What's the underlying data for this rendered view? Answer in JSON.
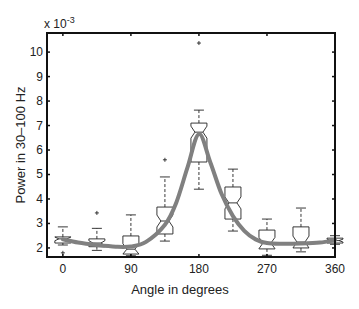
{
  "chart_data": {
    "type": "boxplot",
    "title": "",
    "xlabel": "Angle in degrees",
    "ylabel": "Power in 30–100 Hz",
    "y_multiplier_label": "x 10",
    "y_multiplier_exponent": "-3",
    "xlim": [
      -21,
      360
    ],
    "ylim": [
      1.63,
      10.78
    ],
    "xticks": [
      0,
      90,
      180,
      270,
      360
    ],
    "xtick_labels": [
      "0",
      "90",
      "180",
      "270",
      "360"
    ],
    "yticks": [
      2,
      3,
      4,
      5,
      6,
      7,
      8,
      9,
      10
    ],
    "ytick_labels": [
      "2",
      "3",
      "4",
      "5",
      "6",
      "7",
      "8",
      "9",
      "10"
    ],
    "grid": false,
    "legend": null,
    "boxes": [
      {
        "x": 0,
        "whisker_low": 2.12,
        "q1": 2.2,
        "median": 2.37,
        "q3": 2.45,
        "whisker_high": 2.86,
        "outliers": [
          1.8
        ]
      },
      {
        "x": 45,
        "whisker_low": 1.9,
        "q1": 2.05,
        "median": 2.2,
        "q3": 2.37,
        "whisker_high": 2.8,
        "outliers": [
          3.43
        ]
      },
      {
        "x": 90,
        "whisker_low": 1.68,
        "q1": 1.75,
        "median": 1.95,
        "q3": 2.49,
        "whisker_high": 3.35,
        "outliers": []
      },
      {
        "x": 135,
        "whisker_low": 2.28,
        "q1": 2.57,
        "median": 3.1,
        "q3": 3.67,
        "whisker_high": 4.9,
        "outliers": [
          5.6
        ]
      },
      {
        "x": 180,
        "whisker_low": 4.4,
        "q1": 5.51,
        "median": 6.73,
        "q3": 7.1,
        "whisker_high": 7.63,
        "outliers": [
          10.37
        ]
      },
      {
        "x": 225,
        "whisker_low": 2.69,
        "q1": 3.18,
        "median": 3.84,
        "q3": 4.49,
        "whisker_high": 5.22,
        "outliers": []
      },
      {
        "x": 270,
        "whisker_low": 1.7,
        "q1": 1.96,
        "median": 2.2,
        "q3": 2.73,
        "whisker_high": 3.18,
        "outliers": []
      },
      {
        "x": 315,
        "whisker_low": 1.84,
        "q1": 2.0,
        "median": 2.24,
        "q3": 2.86,
        "whisker_high": 3.63,
        "outliers": []
      },
      {
        "x": 360,
        "whisker_low": 2.15,
        "q1": 2.2,
        "median": 2.3,
        "q3": 2.4,
        "whisker_high": 2.5,
        "outliers": []
      }
    ],
    "fit_curve": {
      "name": "fit",
      "color": "#808080",
      "x": [
        0,
        20,
        45,
        70,
        90,
        110,
        135,
        150,
        165,
        180,
        195,
        210,
        225,
        240,
        255,
        270,
        290,
        315,
        340,
        360
      ],
      "y": [
        2.35,
        2.22,
        2.12,
        2.05,
        2.06,
        2.25,
        2.95,
        3.85,
        5.3,
        6.65,
        5.5,
        4.2,
        3.3,
        2.7,
        2.35,
        2.2,
        2.17,
        2.18,
        2.22,
        2.32
      ]
    }
  },
  "colors": {
    "axes": "#111111",
    "box": "#222222",
    "curve": "#858585"
  }
}
